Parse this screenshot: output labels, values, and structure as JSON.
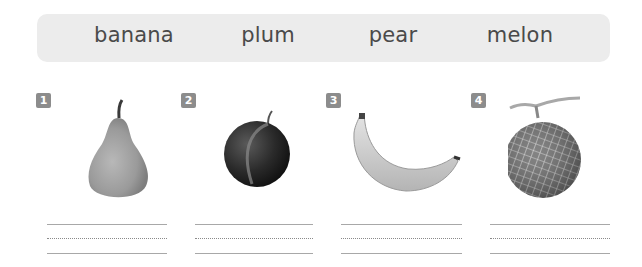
{
  "word_bank": {
    "words": [
      "banana",
      "plum",
      "pear",
      "melon"
    ]
  },
  "items": [
    {
      "number": "1",
      "picture": "pear-picture",
      "answer": ""
    },
    {
      "number": "2",
      "picture": "plum-picture",
      "answer": ""
    },
    {
      "number": "3",
      "picture": "banana-picture",
      "answer": ""
    },
    {
      "number": "4",
      "picture": "melon-picture",
      "answer": ""
    }
  ],
  "colors": {
    "word_bank_bg": "#ececec",
    "word_text": "#4a4a4a",
    "badge_bg": "#8c8c8c",
    "line": "#a8a8a8"
  }
}
